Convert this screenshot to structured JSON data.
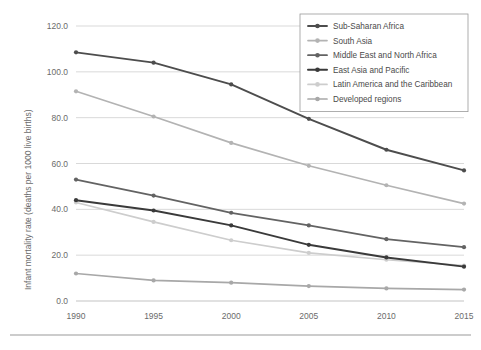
{
  "chart_data": {
    "type": "line",
    "title": "",
    "xlabel": "",
    "ylabel": "Infant mortality rate (deaths per 1000 live births)",
    "categories": [
      "1990",
      "1995",
      "2000",
      "2005",
      "2010",
      "2015"
    ],
    "x": [
      1990,
      1995,
      2000,
      2005,
      2010,
      2015
    ],
    "xlim": [
      1990,
      2015
    ],
    "ylim": [
      0,
      120
    ],
    "ytick_labels": [
      "120.0",
      "100.0",
      "80.0",
      "60.0",
      "40.0",
      "20.0",
      "0.0"
    ],
    "ytick_values": [
      120,
      100,
      80,
      60,
      40,
      20,
      0
    ],
    "grid": "horizontal",
    "legend_position": "top-right",
    "series": [
      {
        "name": "Sub-Saharan Africa",
        "color": "#4d4d4d",
        "width": 1.9,
        "values": [
          108.5,
          104.0,
          94.5,
          79.5,
          66.0,
          57.0
        ]
      },
      {
        "name": "South Asia",
        "color": "#b3b3b3",
        "width": 1.7,
        "values": [
          91.5,
          80.5,
          69.0,
          59.0,
          50.5,
          42.5
        ]
      },
      {
        "name": "Middle East and North Africa",
        "color": "#636363",
        "width": 1.8,
        "values": [
          53.0,
          46.0,
          38.5,
          33.0,
          27.0,
          23.5
        ]
      },
      {
        "name": "East Asia and Pacific",
        "color": "#3a3a3a",
        "width": 2.0,
        "values": [
          44.0,
          39.5,
          33.0,
          24.5,
          19.0,
          15.0
        ]
      },
      {
        "name": "Latin America and the Caribbean",
        "color": "#cdcdcd",
        "width": 1.7,
        "values": [
          43.0,
          34.5,
          26.5,
          21.0,
          18.0,
          15.5
        ]
      },
      {
        "name": "Developed regions",
        "color": "#a8a8a8",
        "width": 1.7,
        "values": [
          12.0,
          9.0,
          8.0,
          6.5,
          5.5,
          5.0
        ]
      }
    ]
  }
}
